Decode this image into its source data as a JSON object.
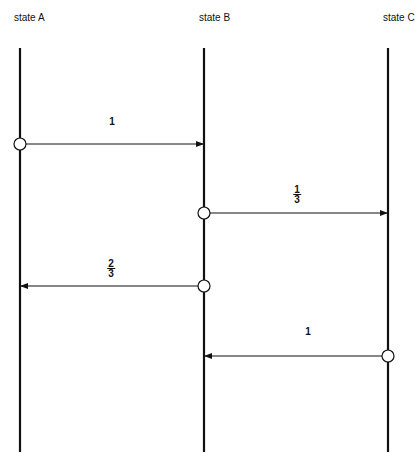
{
  "diagram": {
    "states": [
      {
        "id": "A",
        "label": "state A",
        "x": 20,
        "label_x": 14
      },
      {
        "id": "B",
        "label": "state B",
        "x": 204,
        "label_x": 199
      },
      {
        "id": "C",
        "label": "state C",
        "x": 388,
        "label_x": 383
      }
    ],
    "lifeline": {
      "y_start": 48,
      "y_end": 452
    },
    "transitions": [
      {
        "from": "A",
        "to": "B",
        "y": 144,
        "label": "1",
        "label_num": "1",
        "label_den": "",
        "label_x": 112,
        "label_y": 116
      },
      {
        "from": "B",
        "to": "C",
        "y": 213,
        "label": "1/3",
        "label_num": "1",
        "label_den": "3",
        "label_x": 297,
        "label_y": 184
      },
      {
        "from": "B",
        "to": "A",
        "y": 286,
        "label": "2/3",
        "label_num": "2",
        "label_den": "3",
        "label_x": 111,
        "label_y": 258
      },
      {
        "from": "C",
        "to": "B",
        "y": 356,
        "label": "1",
        "label_num": "1",
        "label_den": "",
        "label_x": 308,
        "label_y": 326
      }
    ],
    "colors": {
      "line": "#111111",
      "background": "#ffffff"
    }
  }
}
